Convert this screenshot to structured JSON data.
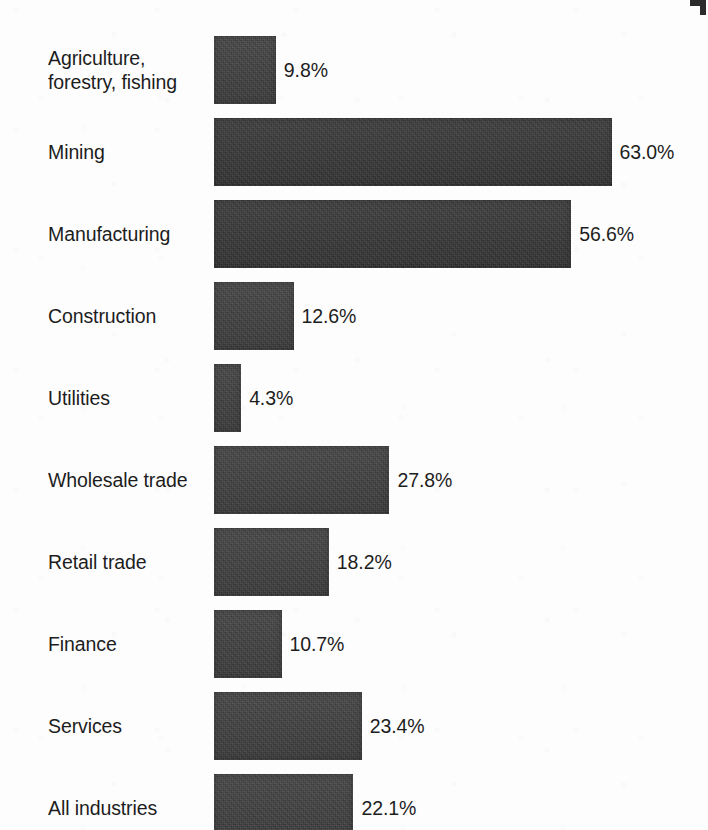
{
  "page": {
    "background_color": "#fdfdfd",
    "bar_color": "#3d3d3d",
    "text_color": "#1d1d1d",
    "width": 708,
    "height": 830
  },
  "marks": {
    "corner_crop_mark": "corner-bracket"
  },
  "chart_data": {
    "type": "bar",
    "orientation": "horizontal",
    "title": "",
    "subtitle": "",
    "xlabel": "",
    "ylabel": "",
    "grid": false,
    "legend": false,
    "axis_visible": false,
    "value_suffix": "%",
    "xlim": [
      0,
      63.0
    ],
    "categories": [
      "Agriculture,\nforestry, fishing",
      "Mining",
      "Manufacturing",
      "Construction",
      "Utilities",
      "Wholesale trade",
      "Retail trade",
      "Finance",
      "Services",
      "All industries"
    ],
    "values": [
      9.8,
      63.0,
      56.6,
      12.6,
      4.3,
      27.8,
      18.2,
      10.7,
      23.4,
      22.1
    ],
    "value_labels": [
      "9.8%",
      "63.0%",
      "56.6%",
      "12.6%",
      "4.3%",
      "27.8%",
      "18.2%",
      "10.7%",
      "23.4%",
      "22.1%"
    ]
  },
  "layout": {
    "bar_origin_x": 214,
    "first_bar_top": 36,
    "bar_height": 68,
    "row_pitch": 82,
    "px_per_percent": 6.31,
    "value_label_gap": 8,
    "label_left": 48
  }
}
